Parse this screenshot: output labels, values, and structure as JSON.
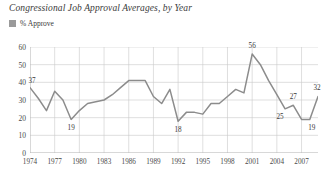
{
  "chart_data": {
    "type": "line",
    "title": "Congressional Job Approval Averages, by Year",
    "xlabel": "",
    "ylabel": "",
    "ylim": [
      0,
      60
    ],
    "ytick_values": [
      0,
      10,
      20,
      30,
      40,
      50,
      60
    ],
    "grid": true,
    "legend_position": "top-left",
    "legend": [
      "% Approve"
    ],
    "series_color": "#8c8c8c",
    "legend_swatch_color": "#9a9a9a",
    "xtick_labels": [
      "1974",
      "1977",
      "1980",
      "1983",
      "1986",
      "1989",
      "1992",
      "1995",
      "1998",
      "2001",
      "2004",
      "2007"
    ],
    "x": [
      1974,
      1975,
      1976,
      1977,
      1978,
      1979,
      1980,
      1981,
      1982,
      1983,
      1984,
      1985,
      1986,
      1987,
      1988,
      1989,
      1990,
      1991,
      1992,
      1993,
      1994,
      1995,
      1996,
      1997,
      1998,
      1999,
      2000,
      2001,
      2002,
      2003,
      2004,
      2005,
      2006,
      2007,
      2008,
      2009
    ],
    "series": [
      {
        "name": "% Approve",
        "values": [
          37,
          31,
          24,
          35,
          30,
          19,
          24,
          28,
          29,
          30,
          33,
          37,
          41,
          41,
          41,
          32,
          28,
          36,
          18,
          23,
          23,
          22,
          28,
          28,
          32,
          36,
          34,
          56,
          50,
          41,
          33,
          25,
          27,
          19,
          19,
          32
        ]
      }
    ],
    "point_labels": [
      {
        "x": 1974,
        "value": 37,
        "text": "37",
        "dx": 2,
        "dy": -7
      },
      {
        "x": 1979,
        "value": 19,
        "text": "19",
        "dx": 0,
        "dy": 9
      },
      {
        "x": 1992,
        "value": 18,
        "text": "18",
        "dx": 0,
        "dy": 9
      },
      {
        "x": 2001,
        "value": 56,
        "text": "56",
        "dx": 0,
        "dy": -8
      },
      {
        "x": 2005,
        "value": 25,
        "text": "25",
        "dx": -5,
        "dy": 8
      },
      {
        "x": 2006,
        "value": 27,
        "text": "27",
        "dx": 0,
        "dy": -8
      },
      {
        "x": 2008,
        "value": 19,
        "text": "19",
        "dx": 2,
        "dy": 9
      },
      {
        "x": 2009,
        "value": 32,
        "text": "32",
        "dx": -1,
        "dy": -8
      }
    ]
  }
}
